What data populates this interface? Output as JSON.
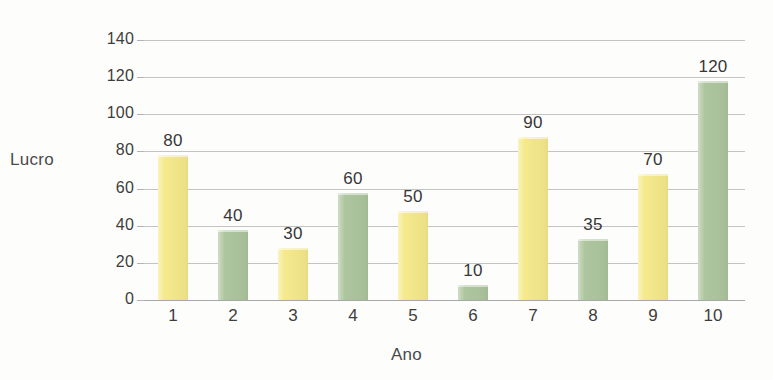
{
  "chart_data": {
    "type": "bar",
    "title": "",
    "xlabel": "Ano",
    "ylabel": "Lucro",
    "categories": [
      "1",
      "2",
      "3",
      "4",
      "5",
      "6",
      "7",
      "8",
      "9",
      "10"
    ],
    "values": [
      80,
      40,
      30,
      60,
      50,
      10,
      90,
      35,
      70,
      120
    ],
    "bar_colors": [
      "#f5e98c",
      "#aec6a0",
      "#f5e98c",
      "#aec6a0",
      "#f5e98c",
      "#aec6a0",
      "#f5e98c",
      "#aec6a0",
      "#f5e98c",
      "#aec6a0"
    ],
    "data_labels": [
      "80",
      "40",
      "30",
      "60",
      "50",
      "10",
      "90",
      "35",
      "70",
      "120"
    ],
    "ylim": [
      0,
      140
    ],
    "yticks": [
      0,
      20,
      40,
      60,
      80,
      100,
      120,
      140
    ],
    "ytick_labels": [
      "0",
      "20",
      "40",
      "60",
      "80",
      "100",
      "120",
      "140"
    ],
    "grid": true,
    "grid_color": "#c3c3c3",
    "legend": "none",
    "palette": {
      "yellow": "#f5e98c",
      "green": "#aec6a0",
      "text": "#3d3d3d",
      "background": "#fdfdfc"
    }
  },
  "axes": {
    "y_title": "Lucro",
    "x_title": "Ano"
  },
  "header": {
    "title_fragment": ""
  }
}
